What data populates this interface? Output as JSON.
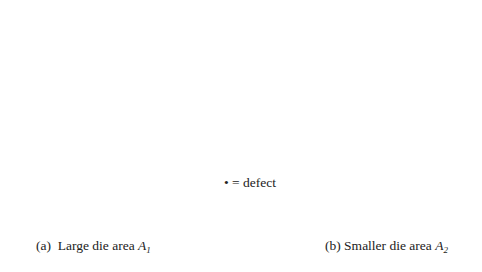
{
  "figure": {
    "type": "wafer-die-defect-diagram",
    "legend": {
      "symbol": "•",
      "text": "= defect"
    },
    "panels": [
      {
        "id": "a",
        "caption_prefix": "(a)  Large die area ",
        "caption_var": "A",
        "caption_sub": "1",
        "die_label_var": "A",
        "die_label_sub": "1",
        "wafer": {
          "cx": 118,
          "cy": 111,
          "r": 96,
          "flat": [
            [
              160,
              25
            ],
            [
              205,
              75
            ]
          ]
        },
        "die_size": [
          25,
          24
        ],
        "dies": [
          [
            69,
            49
          ],
          [
            100,
            49
          ],
          [
            131,
            49
          ],
          [
            39,
            78
          ],
          [
            69,
            78
          ],
          [
            100,
            78
          ],
          [
            131,
            78
          ],
          [
            162,
            78
          ],
          [
            39,
            106
          ],
          [
            69,
            106
          ],
          [
            100,
            106
          ],
          [
            131,
            106
          ],
          [
            162,
            106
          ],
          [
            39,
            135
          ],
          [
            69,
            135
          ],
          [
            100,
            135
          ],
          [
            131,
            135
          ],
          [
            162,
            135
          ],
          [
            69,
            163
          ],
          [
            100,
            163
          ],
          [
            131,
            163
          ]
        ],
        "labeled_die_index": 7,
        "defects": [
          [
            119,
            46
          ],
          [
            60,
            67
          ],
          [
            87,
            72
          ],
          [
            61,
            88
          ],
          [
            118,
            91
          ],
          [
            137,
            98
          ],
          [
            57,
            115
          ],
          [
            83,
            113
          ],
          [
            143,
            124
          ],
          [
            113,
            136
          ],
          [
            131,
            145
          ],
          [
            78,
            145
          ],
          [
            65,
            169
          ],
          [
            106,
            179
          ]
        ]
      },
      {
        "id": "b",
        "caption_prefix": "(b) Smaller die area ",
        "caption_var": "A",
        "caption_sub": "2",
        "die_label_var": "A",
        "die_label_sub": "2",
        "wafer": {
          "cx": 362,
          "cy": 114,
          "r": 93,
          "flat": [
            [
              412,
              24
            ],
            [
              460,
              77
            ]
          ]
        },
        "die_size": [
          16,
          16
        ],
        "dies": [
          [
            333,
            33
          ],
          [
            354,
            33
          ],
          [
            375,
            33
          ],
          [
            396,
            33
          ],
          [
            313,
            53
          ],
          [
            333,
            53
          ],
          [
            354,
            53
          ],
          [
            375,
            53
          ],
          [
            396,
            53
          ],
          [
            417,
            53
          ],
          [
            291,
            73
          ],
          [
            313,
            73
          ],
          [
            333,
            73
          ],
          [
            354,
            73
          ],
          [
            375,
            73
          ],
          [
            396,
            73
          ],
          [
            417,
            73
          ],
          [
            437,
            73
          ],
          [
            291,
            92
          ],
          [
            313,
            92
          ],
          [
            333,
            92
          ],
          [
            354,
            92
          ],
          [
            375,
            92
          ],
          [
            396,
            92
          ],
          [
            417,
            92
          ],
          [
            437,
            92
          ],
          [
            291,
            112
          ],
          [
            313,
            112
          ],
          [
            333,
            112
          ],
          [
            354,
            112
          ],
          [
            375,
            112
          ],
          [
            396,
            112
          ],
          [
            417,
            112
          ],
          [
            437,
            112
          ],
          [
            291,
            131
          ],
          [
            313,
            131
          ],
          [
            333,
            131
          ],
          [
            354,
            131
          ],
          [
            375,
            131
          ],
          [
            396,
            131
          ],
          [
            417,
            131
          ],
          [
            437,
            131
          ],
          [
            313,
            151
          ],
          [
            333,
            151
          ],
          [
            354,
            151
          ],
          [
            375,
            151
          ],
          [
            396,
            151
          ],
          [
            417,
            151
          ],
          [
            333,
            171
          ],
          [
            354,
            171
          ],
          [
            375,
            171
          ],
          [
            396,
            171
          ]
        ],
        "labeled_die_index": 50,
        "defects": [
          [
            371,
            47
          ],
          [
            310,
            68
          ],
          [
            338,
            72
          ],
          [
            316,
            89
          ],
          [
            369,
            91
          ],
          [
            389,
            99
          ],
          [
            307,
            116
          ],
          [
            334,
            114
          ],
          [
            398,
            123
          ],
          [
            330,
            131
          ],
          [
            363,
            137
          ],
          [
            383,
            146
          ],
          [
            315,
            170
          ],
          [
            356,
            180
          ]
        ]
      }
    ]
  }
}
